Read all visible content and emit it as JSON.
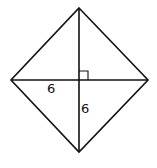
{
  "diagram": {
    "type": "geometry",
    "shape": "rhombus with diagonals",
    "vertices": {
      "top": [
        79,
        8
      ],
      "left": [
        11,
        80
      ],
      "right": [
        148,
        80
      ],
      "bottom": [
        79,
        152
      ]
    },
    "center": [
      79,
      80
    ],
    "right_angle_marker": true,
    "labels": {
      "half_horizontal_diagonal": "6",
      "half_vertical_diagonal": "6"
    },
    "stroke_color": "#111111"
  }
}
